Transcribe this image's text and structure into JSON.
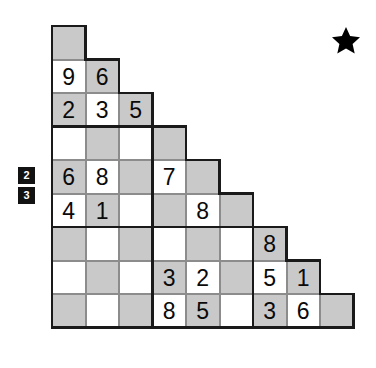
{
  "puzzle": {
    "title": "Staircase Sudoku",
    "type": "triangular-staircase-sudoku",
    "rows": 9,
    "columns": 9,
    "cell_size": 33.5,
    "shading_rule": "gray when (row + col) is even",
    "block_size": 3,
    "colors": {
      "cell_shaded": "#c9c9c9",
      "cell_empty": "#ffffff",
      "grid_line": "#8c8c8c",
      "block_line": "#1a1a1a",
      "digit": "#0a0a0a",
      "clue_box_background": "#121212",
      "clue_box_text": "#ffffff",
      "star": "#000000"
    },
    "grid": [
      {
        "row": 0,
        "cells": [
          ""
        ]
      },
      {
        "row": 1,
        "cells": [
          "9",
          "6"
        ]
      },
      {
        "row": 2,
        "cells": [
          "2",
          "3",
          "5"
        ]
      },
      {
        "row": 3,
        "cells": [
          "",
          "",
          "",
          ""
        ]
      },
      {
        "row": 4,
        "cells": [
          "6",
          "8",
          "",
          "7",
          ""
        ]
      },
      {
        "row": 5,
        "cells": [
          "4",
          "1",
          "",
          "",
          "8",
          ""
        ]
      },
      {
        "row": 6,
        "cells": [
          "",
          "",
          "",
          "",
          "",
          "",
          "8"
        ]
      },
      {
        "row": 7,
        "cells": [
          "",
          "",
          "",
          "3",
          "2",
          "",
          "5",
          "1"
        ]
      },
      {
        "row": 8,
        "cells": [
          "",
          "",
          "",
          "8",
          "5",
          "",
          "3",
          "6",
          ""
        ]
      }
    ]
  },
  "side_clues": {
    "name": "row-clue-stack",
    "values": [
      "2",
      "3"
    ]
  },
  "marker": {
    "name": "star-marker",
    "glyph": "★",
    "label": "star"
  }
}
